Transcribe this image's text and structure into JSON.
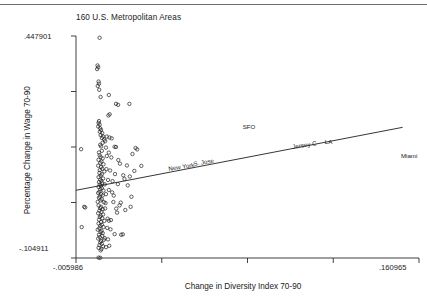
{
  "chart_data": {
    "type": "scatter",
    "title": "160 U.S. Metropolitan Areas",
    "xlabel": "Change in Diversity Index 70-90",
    "ylabel": "Percentage Change in Wage 70-90",
    "xlim": [
      -0.005986,
      0.160965
    ],
    "ylim": [
      -0.104911,
      0.447901
    ],
    "xticklabels": [
      "-.005986",
      ".160965"
    ],
    "yticklabels": [
      ".447901",
      "-.104911"
    ],
    "grid": false,
    "legend": null,
    "marker": "open-circle",
    "fit_line": {
      "label": "linear fit",
      "x0": -0.005986,
      "y0": 0.0637,
      "x1": 0.153,
      "y1": 0.2205
    },
    "annotations": [
      {
        "text": "SFO",
        "x": 0.08,
        "y": 0.218
      },
      {
        "text": "Jersey C",
        "x": 0.1045,
        "y": 0.17
      },
      {
        "text": "LA",
        "x": 0.12,
        "y": 0.181
      },
      {
        "text": "S. Jose",
        "x": 0.0565,
        "y": 0.1265
      },
      {
        "text": "New York",
        "x": 0.044,
        "y": 0.114
      },
      {
        "text": "Miami",
        "x": 0.157,
        "y": 0.1465
      }
    ],
    "points": [
      [
        0.0055,
        0.4435
      ],
      [
        0.0045,
        0.3745
      ],
      [
        0.0048,
        0.37
      ],
      [
        0.0043,
        0.3655
      ],
      [
        0.005,
        0.3345
      ],
      [
        0.0052,
        0.329
      ],
      [
        0.0046,
        0.3235
      ],
      [
        0.0053,
        0.314
      ],
      [
        0.01,
        0.301
      ],
      [
        0.006,
        0.296
      ],
      [
        0.0135,
        0.279
      ],
      [
        0.0145,
        0.2765
      ],
      [
        0.02,
        0.279
      ],
      [
        0.0052,
        0.236
      ],
      [
        0.005,
        0.2315
      ],
      [
        0.0055,
        0.227
      ],
      [
        0.0048,
        0.2225
      ],
      [
        0.0058,
        0.218
      ],
      [
        0.0062,
        0.214
      ],
      [
        0.0056,
        0.2095
      ],
      [
        0.0068,
        0.206
      ],
      [
        0.006,
        0.2015
      ],
      [
        0.0072,
        0.1975
      ],
      [
        0.0066,
        0.194
      ],
      [
        0.0078,
        0.19
      ],
      [
        0.0103,
        0.195
      ],
      [
        0.0082,
        0.186
      ],
      [
        0.007,
        0.182
      ],
      [
        -0.0035,
        0.166
      ],
      [
        0.0058,
        0.177
      ],
      [
        0.0062,
        0.173
      ],
      [
        0.0086,
        0.17
      ],
      [
        0.0128,
        0.172
      ],
      [
        0.0135,
        0.1715
      ],
      [
        0.023,
        0.169
      ],
      [
        0.0238,
        0.1655
      ],
      [
        0.0066,
        0.162
      ],
      [
        0.0052,
        0.158
      ],
      [
        0.01,
        0.1575
      ],
      [
        0.0215,
        0.154
      ],
      [
        0.0055,
        0.151
      ],
      [
        0.006,
        0.1465
      ],
      [
        0.007,
        0.143
      ],
      [
        0.005,
        0.1395
      ],
      [
        0.0064,
        0.1355
      ],
      [
        0.0058,
        0.132
      ],
      [
        0.0074,
        0.1285
      ],
      [
        0.0048,
        0.125
      ],
      [
        0.0154,
        0.13
      ],
      [
        0.0188,
        0.1255
      ],
      [
        0.0258,
        0.1245
      ],
      [
        0.0062,
        0.1215
      ],
      [
        0.0068,
        0.1175
      ],
      [
        0.0056,
        0.114
      ],
      [
        0.0078,
        0.1105
      ],
      [
        0.0054,
        0.107
      ],
      [
        0.0066,
        0.1035
      ],
      [
        0.006,
        0.1
      ],
      [
        0.013,
        0.104
      ],
      [
        0.017,
        0.101
      ],
      [
        0.005,
        0.0965
      ],
      [
        0.0072,
        0.093
      ],
      [
        0.0058,
        0.09
      ],
      [
        0.0064,
        0.087
      ],
      [
        0.0096,
        0.0895
      ],
      [
        0.0118,
        0.0865
      ],
      [
        0.0052,
        0.084
      ],
      [
        0.0068,
        0.081
      ],
      [
        0.0056,
        0.078
      ],
      [
        0.0062,
        0.075
      ],
      [
        0.008,
        0.0785
      ],
      [
        0.0144,
        0.079
      ],
      [
        0.0192,
        0.076
      ],
      [
        0.005,
        0.072
      ],
      [
        0.0066,
        0.069
      ],
      [
        0.0058,
        0.066
      ],
      [
        0.0074,
        0.063
      ],
      [
        0.0054,
        0.06
      ],
      [
        0.01,
        0.0645
      ],
      [
        0.0048,
        0.057
      ],
      [
        0.0062,
        0.054
      ],
      [
        0.007,
        0.051
      ],
      [
        0.0056,
        0.048
      ],
      [
        0.0124,
        0.0505
      ],
      [
        0.021,
        0.0475
      ],
      [
        0.0052,
        0.045
      ],
      [
        0.0066,
        0.0415
      ],
      [
        0.006,
        0.0385
      ],
      [
        0.0046,
        0.035
      ],
      [
        0.0076,
        0.034
      ],
      [
        0.0158,
        0.033
      ],
      [
        -0.002,
        0.0225
      ],
      [
        -0.0015,
        0.021
      ],
      [
        0.005,
        0.026
      ],
      [
        0.0062,
        0.0225
      ],
      [
        0.0058,
        0.0195
      ],
      [
        0.007,
        0.0165
      ],
      [
        0.0054,
        0.013
      ],
      [
        0.0064,
        0.01
      ],
      [
        0.0136,
        0.018
      ],
      [
        0.018,
        0.0145
      ],
      [
        0.0048,
        0.0065
      ],
      [
        0.0072,
        0.0035
      ],
      [
        0.006,
        0.0005
      ],
      [
        0.0056,
        -0.003
      ],
      [
        0.0068,
        -0.006
      ],
      [
        0.0052,
        -0.0095
      ],
      [
        0.0078,
        -0.0125
      ],
      [
        0.0062,
        -0.0155
      ],
      [
        0.01,
        -0.012
      ],
      [
        0.005,
        -0.019
      ],
      [
        0.0066,
        -0.022
      ],
      [
        0.0058,
        -0.025
      ],
      [
        0.0074,
        -0.028
      ],
      [
        0.0054,
        -0.031
      ],
      [
        -0.0032,
        -0.028
      ],
      [
        0.0046,
        -0.0345
      ],
      [
        0.0064,
        -0.0375
      ],
      [
        0.006,
        -0.0405
      ],
      [
        0.007,
        -0.043
      ],
      [
        0.0128,
        -0.0455
      ],
      [
        0.016,
        -0.047
      ],
      [
        0.0168,
        -0.046
      ],
      [
        0.0052,
        -0.047
      ],
      [
        0.0068,
        -0.05
      ],
      [
        0.0056,
        -0.053
      ],
      [
        0.0048,
        -0.0565
      ],
      [
        0.0076,
        -0.0595
      ],
      [
        0.0062,
        -0.0625
      ],
      [
        0.0058,
        -0.066
      ],
      [
        0.0066,
        -0.0695
      ],
      [
        0.0054,
        -0.073
      ],
      [
        0.0072,
        -0.076
      ],
      [
        0.005,
        -0.0795
      ],
      [
        0.0064,
        -0.0825
      ],
      [
        0.006,
        -0.086
      ],
      [
        0.005,
        -0.104
      ],
      [
        0.0058,
        -0.1045
      ],
      [
        0.009,
        0.149
      ],
      [
        0.0112,
        0.1455
      ],
      [
        0.0088,
        0.1165
      ],
      [
        0.0106,
        0.113
      ],
      [
        0.0146,
        0.139
      ],
      [
        0.0224,
        0.112
      ],
      [
        0.0202,
        0.098
      ],
      [
        0.0176,
        0.092
      ],
      [
        0.0086,
        0.054
      ],
      [
        0.0116,
        0.0585
      ],
      [
        0.0152,
        0.026
      ],
      [
        0.0206,
        0.0225
      ],
      [
        0.0094,
        -0.007
      ],
      [
        0.011,
        -0.0105
      ],
      [
        0.014,
        0.008
      ],
      [
        0.0084,
        0.032
      ],
      [
        0.0122,
        0.0345
      ],
      [
        0.0098,
        0.25
      ],
      [
        0.0104,
        0.253
      ],
      [
        0.009,
        0.1975
      ],
      [
        0.0114,
        0.193
      ],
      [
        0.0082,
        0.0185
      ],
      [
        0.0092,
        -0.03
      ],
      [
        0.0108,
        -0.0335
      ],
      [
        0.008,
        -0.0555
      ],
      [
        0.0096,
        -0.0585
      ],
      [
        0.0086,
        -0.078
      ],
      [
        0.0102,
        -0.0745
      ]
    ]
  },
  "axes": {
    "y_tick_count": 5,
    "x_tick_count": 5
  }
}
